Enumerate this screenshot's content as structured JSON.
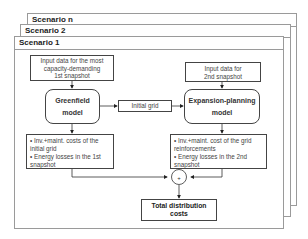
{
  "frames": [
    {
      "label": "Scenario n"
    },
    {
      "label": "Scenario 2"
    },
    {
      "label": "Scenario 1"
    }
  ],
  "greenfield": {
    "input_line1": "Input data for the most",
    "input_line2": "capacity-demanding",
    "input_line3": "1st snapshot",
    "model_line1": "Greenfield",
    "model_line2": "model",
    "out_item1": "• Inv.+maint. costs of the initial grid",
    "out_item2": "• Energy losses in the 1st snapshot"
  },
  "initial_grid": {
    "label": "Initial grid"
  },
  "expansion": {
    "input_line1": "Input data for",
    "input_line2": "2nd snapshot",
    "model_line1": "Expansion-planning",
    "model_line2": "model",
    "out_item1": "• Inv.+maint. cost of the grid reinforcements",
    "out_item2": "• Energy losses in the 2nd snapshot"
  },
  "sum_node": {
    "symbol": "+"
  },
  "total": {
    "line1": "Total distribution",
    "line2": "costs"
  }
}
